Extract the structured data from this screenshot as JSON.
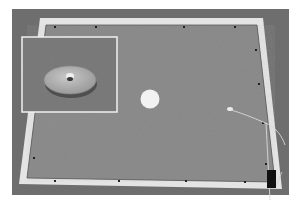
{
  "image": {
    "kind": "photograph",
    "description": "Grayscale photo of a square test board with white frame, central white disk, and magnified inset of a metal puck",
    "colors": {
      "background": "#ffffff",
      "floor": "#6e6e6e",
      "board_surface": "#8d8d8d",
      "frame": "#e6e6e6",
      "target_disk": "#f2f2f2",
      "puck": "#b4b4b4",
      "inset_border": "#f0f0f0",
      "connector": "#111111"
    },
    "elements": {
      "board": "square board with white frame border",
      "target": "white circular disk near center",
      "inset": "zoomed view of circular puck with center post",
      "cable": "thin cable running from board to lower right",
      "connector": "black connector block at bottom right corner"
    }
  }
}
